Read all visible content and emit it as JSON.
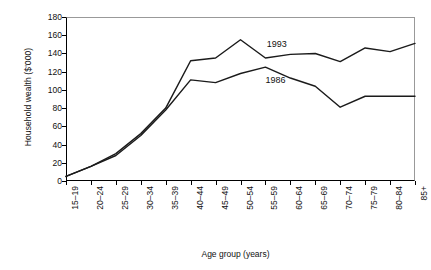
{
  "chart_data": {
    "type": "line",
    "title": "",
    "xlabel": "Age group (years)",
    "ylabel": "Household wealth ($'000)",
    "categories": [
      "15–19",
      "20–24",
      "25–29",
      "30–34",
      "35–39",
      "40–44",
      "45–49",
      "50–54",
      "55–59",
      "60–64",
      "65–69",
      "70–74",
      "75–79",
      "80–84",
      "85+"
    ],
    "ylim": [
      0,
      180
    ],
    "yticks": [
      0,
      20,
      40,
      60,
      80,
      100,
      120,
      140,
      160,
      180
    ],
    "grid": false,
    "legend_position": "inline-annotation",
    "series": [
      {
        "name": "1993",
        "color": "#1b1b1b",
        "values": [
          5,
          16,
          30,
          52,
          80,
          132,
          135,
          155,
          135,
          139,
          140,
          131,
          146,
          142,
          151
        ]
      },
      {
        "name": "1986",
        "color": "#1b1b1b",
        "values": [
          5,
          16,
          28,
          50,
          78,
          111,
          108,
          118,
          125,
          113,
          104,
          81,
          93,
          93,
          93
        ]
      }
    ],
    "annotations": [
      {
        "text": "1993",
        "x_index": 8.05,
        "y_value": 149
      },
      {
        "text": "1986",
        "x_index": 8.0,
        "y_value": 110
      }
    ]
  }
}
